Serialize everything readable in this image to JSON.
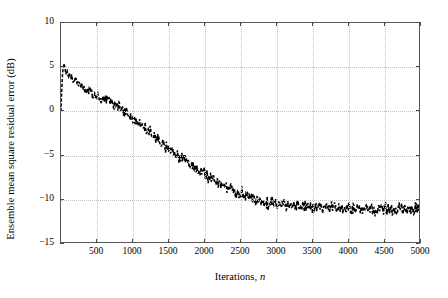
{
  "chart_data": {
    "type": "line",
    "title": "",
    "xlabel": "Iterations, n",
    "xlabel_plain": "Iterations,",
    "xlabel_italic": "n",
    "ylabel": "Ensemble mean square residual error (dB)",
    "xlim": [
      0,
      5000
    ],
    "ylim": [
      -15,
      10
    ],
    "grid": true,
    "legend": "none",
    "line_style": "dashed-noisy",
    "line_color": "#000000",
    "xticks": [
      500,
      1000,
      1500,
      2000,
      2500,
      3000,
      3500,
      4000,
      4500,
      5000
    ],
    "xticklabels": [
      "500",
      "1000",
      "1500",
      "2000",
      "2500",
      "3000",
      "3500",
      "4000",
      "4500",
      "5000"
    ],
    "yticks": [
      10,
      5,
      0,
      -5,
      -10,
      -15
    ],
    "yticklabels": [
      "10",
      "5",
      "0",
      "−5",
      "−10",
      "−15"
    ],
    "series": [
      {
        "name": "ensemble mean square residual error",
        "x": [
          0,
          10,
          20,
          30,
          40,
          50,
          60,
          70,
          80,
          90,
          100,
          120,
          140,
          160,
          180,
          200,
          250,
          300,
          350,
          400,
          450,
          500,
          550,
          600,
          650,
          700,
          750,
          800,
          850,
          900,
          950,
          1000,
          1050,
          1100,
          1150,
          1200,
          1250,
          1300,
          1350,
          1400,
          1450,
          1500,
          1550,
          1600,
          1650,
          1700,
          1750,
          1800,
          1850,
          1900,
          1950,
          2000,
          2050,
          2100,
          2150,
          2200,
          2250,
          2300,
          2350,
          2400,
          2450,
          2500,
          2550,
          2600,
          2650,
          2700,
          2750,
          2800,
          2850,
          2900,
          2950,
          3000,
          3050,
          3100,
          3150,
          3200,
          3250,
          3300,
          3350,
          3400,
          3450,
          3500,
          3550,
          3600,
          3650,
          3700,
          3750,
          3800,
          3850,
          3900,
          3950,
          4000,
          4050,
          4100,
          4150,
          4200,
          4250,
          4300,
          4350,
          4400,
          4450,
          4500,
          4550,
          4600,
          4650,
          4700,
          4750,
          4800,
          4850,
          4900,
          4950,
          5000
        ],
        "y": [
          0.0,
          2.4,
          4.1,
          5.0,
          5.3,
          5.1,
          4.6,
          4.3,
          4.5,
          4.2,
          4.1,
          4.3,
          4.0,
          3.8,
          3.6,
          3.5,
          3.1,
          2.8,
          2.5,
          2.2,
          1.9,
          1.7,
          1.4,
          1.3,
          1.5,
          1.2,
          0.8,
          0.5,
          0.2,
          -0.1,
          -0.4,
          -0.7,
          -1.1,
          -1.4,
          -1.8,
          -2.1,
          -2.5,
          -2.8,
          -3.2,
          -3.5,
          -3.9,
          -4.2,
          -4.6,
          -4.8,
          -5.2,
          -5.4,
          -5.8,
          -6.0,
          -6.3,
          -6.6,
          -6.9,
          -7.2,
          -7.4,
          -7.7,
          -7.9,
          -8.2,
          -8.4,
          -8.6,
          -8.8,
          -9.0,
          -9.2,
          -9.3,
          -9.5,
          -9.6,
          -9.8,
          -9.9,
          -10.0,
          -10.1,
          -10.2,
          -10.3,
          -10.3,
          -10.4,
          -10.5,
          -10.5,
          -10.6,
          -10.6,
          -10.7,
          -10.7,
          -10.7,
          -10.8,
          -10.8,
          -10.8,
          -10.8,
          -10.9,
          -10.9,
          -10.9,
          -10.9,
          -10.9,
          -11.0,
          -11.0,
          -11.0,
          -11.0,
          -11.0,
          -11.0,
          -11.0,
          -11.0,
          -11.0,
          -11.0,
          -11.0,
          -11.0,
          -11.0,
          -11.0,
          -11.0,
          -11.0,
          -11.0,
          -11.0,
          -11.0,
          -11.0,
          -11.0,
          -11.0,
          -11.0,
          -11.0
        ],
        "noise_amplitude_db": 0.55,
        "plateau_value_db": -11.0,
        "peak_value_db": 5.3,
        "start_value_db": 0.0
      }
    ]
  }
}
